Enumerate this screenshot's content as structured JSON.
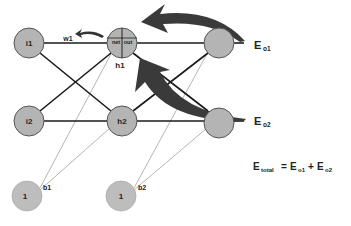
{
  "diagram": {
    "type": "neural-network-backprop",
    "nodes": {
      "i1": {
        "label": "i1"
      },
      "i2": {
        "label": "i2"
      },
      "h1": {
        "label": "h1",
        "inner_left": "net",
        "inner_right": "out"
      },
      "h2": {
        "label": "h2"
      },
      "o1": {
        "label": ""
      },
      "o2": {
        "label": ""
      },
      "b1": {
        "label": "1",
        "tag": "b1"
      },
      "b2": {
        "label": "1",
        "tag": "b2"
      }
    },
    "weight_label": "w1",
    "errors": {
      "e_o1": {
        "main": "E",
        "sub": "o1"
      },
      "e_o2": {
        "main": "E",
        "sub": "o2"
      }
    },
    "equation": {
      "lhs_main": "E",
      "lhs_sub": "total",
      "eq": "=",
      "t1_main": "E",
      "t1_sub": "o1",
      "plus": "+",
      "t2_main": "E",
      "t2_sub": "o2"
    },
    "colors": {
      "node_fill": "#b4b4b4",
      "node_stroke": "#555555",
      "edge": "#1a1a1a",
      "bias_edge": "#b0b0b0",
      "arrow": "#3a3a3a"
    }
  }
}
